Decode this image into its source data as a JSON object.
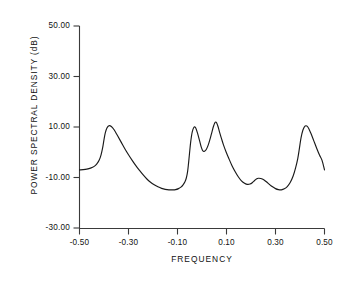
{
  "chart_data": {
    "type": "line",
    "title": "",
    "subtitle": "",
    "xlabel": "FREQUENCY",
    "ylabel": "POWER SPECTRAL DENSITY (dB)",
    "xlim": [
      -0.5,
      0.5
    ],
    "ylim": [
      -30.0,
      50.0
    ],
    "grid": false,
    "legend": null,
    "xticks": [
      -0.5,
      -0.3,
      -0.1,
      0.1,
      0.3,
      0.5
    ],
    "xticklabels": [
      "-0.50",
      "-0.30",
      "-0.10",
      "0.10",
      "0.30",
      "0.50"
    ],
    "yticks": [
      -30.0,
      -10.0,
      10.0,
      30.0,
      50.0
    ],
    "yticklabels": [
      "-30.00",
      "-10.00",
      "10.00",
      "30.00",
      "50.00"
    ],
    "line_color": "#1a1a1a",
    "annotations": [],
    "series": [
      {
        "name": "power spectral density",
        "x": [
          -0.5,
          -0.485,
          -0.47,
          -0.455,
          -0.44,
          -0.43,
          -0.42,
          -0.412,
          -0.405,
          -0.4,
          -0.395,
          -0.388,
          -0.38,
          -0.37,
          -0.358,
          -0.345,
          -0.33,
          -0.315,
          -0.3,
          -0.285,
          -0.27,
          -0.255,
          -0.24,
          -0.225,
          -0.21,
          -0.195,
          -0.18,
          -0.165,
          -0.15,
          -0.135,
          -0.12,
          -0.108,
          -0.096,
          -0.086,
          -0.078,
          -0.07,
          -0.064,
          -0.059,
          -0.055,
          -0.051,
          -0.046,
          -0.04,
          -0.033,
          -0.026,
          -0.018,
          -0.01,
          -0.003,
          0.003,
          0.01,
          0.018,
          0.026,
          0.034,
          0.041,
          0.047,
          0.052,
          0.056,
          0.06,
          0.065,
          0.071,
          0.079,
          0.088,
          0.098,
          0.11,
          0.122,
          0.135,
          0.148,
          0.16,
          0.172,
          0.184,
          0.196,
          0.206,
          0.215,
          0.222,
          0.23,
          0.24,
          0.252,
          0.264,
          0.276,
          0.288,
          0.3,
          0.312,
          0.324,
          0.336,
          0.348,
          0.36,
          0.372,
          0.382,
          0.391,
          0.398,
          0.404,
          0.412,
          0.421,
          0.432,
          0.444,
          0.456,
          0.468,
          0.48,
          0.49,
          0.5
        ],
        "y": [
          -7.0,
          -6.9,
          -6.7,
          -6.3,
          -5.6,
          -4.7,
          -3.2,
          -1.0,
          2.0,
          5.0,
          7.6,
          9.6,
          10.5,
          10.2,
          8.8,
          6.6,
          4.0,
          1.4,
          -1.0,
          -3.2,
          -5.3,
          -7.2,
          -9.0,
          -10.6,
          -11.9,
          -12.9,
          -13.7,
          -14.3,
          -14.7,
          -14.9,
          -14.9,
          -14.8,
          -14.4,
          -13.8,
          -13.0,
          -11.8,
          -10.2,
          -7.8,
          -4.4,
          -0.5,
          4.2,
          8.0,
          9.9,
          9.7,
          7.5,
          4.6,
          2.0,
          0.6,
          0.4,
          1.2,
          3.0,
          5.6,
          8.2,
          10.3,
          11.6,
          12.0,
          11.6,
          10.3,
          8.2,
          5.6,
          2.8,
          0.2,
          -2.6,
          -5.2,
          -7.6,
          -9.7,
          -11.2,
          -12.2,
          -12.7,
          -12.6,
          -12.0,
          -11.2,
          -10.6,
          -10.3,
          -10.4,
          -10.9,
          -11.8,
          -12.8,
          -13.7,
          -14.4,
          -14.8,
          -14.9,
          -14.5,
          -13.6,
          -12.0,
          -9.4,
          -6.2,
          -2.4,
          1.8,
          5.6,
          8.8,
          10.4,
          10.0,
          7.6,
          4.6,
          1.6,
          -1.2,
          -3.2,
          -7.0
        ]
      }
    ]
  },
  "axes": {
    "x_tick_labels": [
      "-0.50",
      "-0.30",
      "-0.10",
      "0.10",
      "0.30",
      "0.50"
    ],
    "y_tick_labels": [
      "50.00",
      "30.00",
      "10.00",
      "-10.00",
      "-30.00"
    ],
    "x_title": "FREQUENCY",
    "y_title": "POWER SPECTRAL DENSITY (dB)"
  }
}
